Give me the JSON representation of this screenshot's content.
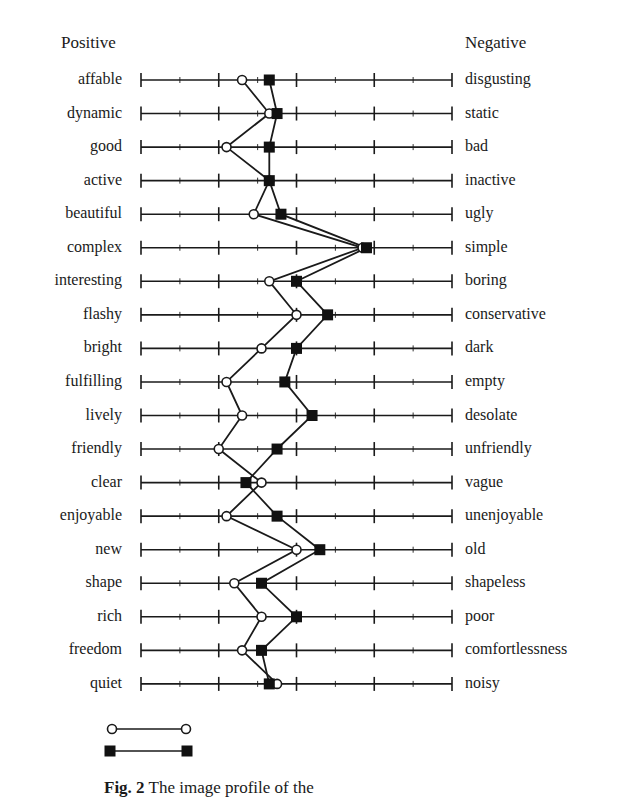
{
  "header": {
    "positive": "Positive",
    "negative": "Negative"
  },
  "caption": {
    "fig": "Fig. 2",
    "text": " The image profile of the"
  },
  "colors": {
    "line": "#1a1a1a",
    "open_fill": "#ffffff",
    "filled": "#111111"
  },
  "chart_data": {
    "type": "line",
    "title": "",
    "orientation": "semantic-differential (horizontal scale per row)",
    "scale": {
      "min": 1,
      "max": 9,
      "major_ticks": [
        1,
        3,
        5,
        7,
        9
      ],
      "minor_ticks": [
        2,
        4,
        6,
        8
      ]
    },
    "left_header": "Positive",
    "right_header": "Negative",
    "categories": [
      "affable",
      "dynamic",
      "good",
      "active",
      "beautiful",
      "complex",
      "interesting",
      "flashy",
      "bright",
      "fulfilling",
      "lively",
      "friendly",
      "clear",
      "enjoyable",
      "new",
      "shape",
      "rich",
      "freedom",
      "quiet"
    ],
    "opposites": [
      "disgusting",
      "static",
      "bad",
      "inactive",
      "ugly",
      "simple",
      "boring",
      "conservative",
      "dark",
      "empty",
      "desolate",
      "unfriendly",
      "vague",
      "unenjoyable",
      "old",
      "shapeless",
      "poor",
      "comfortlessness",
      "noisy"
    ],
    "series": [
      {
        "name": "",
        "marker": "open-circle",
        "values": [
          3.6,
          4.3,
          3.2,
          4.3,
          3.9,
          6.7,
          4.3,
          5.0,
          4.1,
          3.2,
          3.6,
          3.0,
          4.1,
          3.2,
          5.0,
          3.4,
          4.1,
          3.6,
          4.5
        ]
      },
      {
        "name": "",
        "marker": "filled-square",
        "values": [
          4.3,
          4.5,
          4.3,
          4.3,
          4.6,
          6.8,
          5.0,
          5.8,
          5.0,
          4.7,
          5.4,
          4.5,
          3.7,
          4.5,
          5.6,
          4.1,
          5.0,
          4.1,
          4.3
        ]
      }
    ],
    "legend": {
      "position": "bottom-left",
      "entries": [
        "",
        ""
      ]
    },
    "grid": false
  }
}
